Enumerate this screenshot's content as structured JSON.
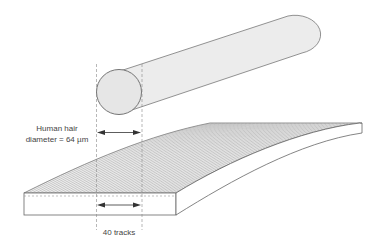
{
  "diagram": {
    "hair_label_line1": "Human hair",
    "hair_label_line2": "diameter = 64 µm",
    "tracks_label": "40 tracks",
    "colors": {
      "stroke": "#666666",
      "hair_fill": "#ececec",
      "tape_face": "#ffffff",
      "dashed": "#888888"
    },
    "elements": [
      "human-hair-cylinder",
      "magnetic-tape-strip",
      "diameter-dimension-arrow",
      "tracks-dimension-arrow"
    ]
  }
}
